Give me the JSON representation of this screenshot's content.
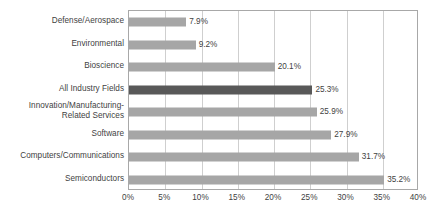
{
  "chart_data": {
    "type": "bar",
    "orientation": "horizontal",
    "title": "",
    "subtitle": "",
    "xlabel": "",
    "ylabel": "",
    "xlim": [
      0,
      40
    ],
    "xtick_step": 5,
    "grid": true,
    "legend": false,
    "value_label_suffix": "%",
    "categories": [
      "Defense/Aerospace",
      "Environmental",
      "Bioscience",
      "All Industry Fields",
      "Innovation/Manufacturing-\nRelated Services",
      "Software",
      "Computers/Communications",
      "Semiconductors"
    ],
    "values": [
      7.9,
      9.2,
      20.1,
      25.3,
      25.9,
      27.9,
      31.7,
      35.2
    ],
    "value_labels": [
      "7.9%",
      "9.2%",
      "20.1%",
      "25.3%",
      "25.9%",
      "27.9%",
      "31.7%",
      "35.2%"
    ],
    "highlight_index": 3,
    "xtick_labels": [
      "0%",
      "5%",
      "10%",
      "15%",
      "20%",
      "25%",
      "30%",
      "35%",
      "40%"
    ],
    "xtick_values": [
      0,
      5,
      10,
      15,
      20,
      25,
      30,
      35,
      40
    ],
    "colors": {
      "bar": "#a6a6a6",
      "bar_highlight": "#595959",
      "gridline": "#cfcfcf",
      "axis_border": "#a8a8a8",
      "text": "#3f3f3f",
      "background": "#ffffff"
    }
  }
}
